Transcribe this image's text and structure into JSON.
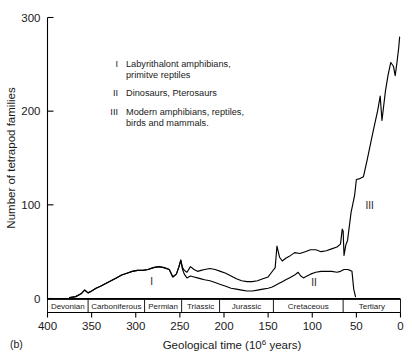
{
  "panel_label": "(b)",
  "chart_data": {
    "type": "line",
    "title": "",
    "xlabel": "Geological time (10⁶ years)",
    "xlabel_parts": {
      "pre": "Geological time (10",
      "sup": "6",
      "post": " years)"
    },
    "ylabel": "Number of tetrapod families",
    "xlim": [
      400,
      0
    ],
    "ylim": [
      0,
      300
    ],
    "x_ticks": [
      400,
      350,
      300,
      250,
      200,
      150,
      100,
      50,
      0
    ],
    "y_ticks": [
      0,
      100,
      200,
      300
    ],
    "x_axis_inverted": true,
    "grid": false,
    "legend_position": "inside-upper-left",
    "series": [
      {
        "name": "Total tetrapod families",
        "points": [
          [
            375,
            1
          ],
          [
            368,
            2
          ],
          [
            362,
            5
          ],
          [
            358,
            9
          ],
          [
            354,
            6
          ],
          [
            350,
            8
          ],
          [
            345,
            11
          ],
          [
            340,
            13
          ],
          [
            334,
            16
          ],
          [
            328,
            19
          ],
          [
            322,
            22
          ],
          [
            316,
            25
          ],
          [
            310,
            27
          ],
          [
            304,
            29
          ],
          [
            298,
            30
          ],
          [
            292,
            30
          ],
          [
            286,
            31
          ],
          [
            280,
            33
          ],
          [
            274,
            34
          ],
          [
            268,
            33
          ],
          [
            262,
            31
          ],
          [
            258,
            23
          ],
          [
            254,
            26
          ],
          [
            251,
            34
          ],
          [
            249,
            41
          ],
          [
            247,
            33
          ],
          [
            245,
            30
          ],
          [
            242,
            28
          ],
          [
            238,
            34
          ],
          [
            234,
            31
          ],
          [
            230,
            29
          ],
          [
            226,
            30
          ],
          [
            222,
            31
          ],
          [
            216,
            32
          ],
          [
            210,
            31
          ],
          [
            204,
            29
          ],
          [
            198,
            27
          ],
          [
            192,
            24
          ],
          [
            186,
            21
          ],
          [
            180,
            19
          ],
          [
            174,
            18
          ],
          [
            168,
            18
          ],
          [
            162,
            19
          ],
          [
            156,
            21
          ],
          [
            150,
            23
          ],
          [
            146,
            28
          ],
          [
            142,
            33
          ],
          [
            140,
            56
          ],
          [
            137,
            44
          ],
          [
            134,
            40
          ],
          [
            130,
            43
          ],
          [
            126,
            45
          ],
          [
            120,
            49
          ],
          [
            114,
            48
          ],
          [
            108,
            50
          ],
          [
            102,
            52
          ],
          [
            96,
            52
          ],
          [
            90,
            50
          ],
          [
            84,
            51
          ],
          [
            78,
            53
          ],
          [
            72,
            55
          ],
          [
            68,
            58
          ],
          [
            66,
            74
          ],
          [
            65,
            72
          ],
          [
            64,
            46
          ],
          [
            62,
            57
          ],
          [
            60,
            62
          ],
          [
            56,
            92
          ],
          [
            52,
            110
          ],
          [
            50,
            127
          ],
          [
            46,
            128
          ],
          [
            42,
            130
          ],
          [
            38,
            147
          ],
          [
            34,
            165
          ],
          [
            30,
            183
          ],
          [
            26,
            200
          ],
          [
            23,
            216
          ],
          [
            21,
            190
          ],
          [
            19,
            206
          ],
          [
            17,
            222
          ],
          [
            14,
            239
          ],
          [
            11,
            252
          ],
          [
            8,
            248
          ],
          [
            6,
            238
          ],
          [
            4,
            252
          ],
          [
            2,
            268
          ],
          [
            1,
            279
          ]
        ]
      },
      {
        "name": "Lower curve",
        "points": [
          [
            375,
            1
          ],
          [
            368,
            2
          ],
          [
            362,
            5
          ],
          [
            358,
            9
          ],
          [
            354,
            6
          ],
          [
            350,
            8
          ],
          [
            345,
            11
          ],
          [
            340,
            13
          ],
          [
            334,
            16
          ],
          [
            328,
            19
          ],
          [
            322,
            22
          ],
          [
            316,
            25
          ],
          [
            310,
            27
          ],
          [
            304,
            29
          ],
          [
            298,
            30
          ],
          [
            292,
            30
          ],
          [
            286,
            31
          ],
          [
            280,
            33
          ],
          [
            274,
            34
          ],
          [
            268,
            33
          ],
          [
            262,
            31
          ],
          [
            258,
            23
          ],
          [
            254,
            26
          ],
          [
            251,
            34
          ],
          [
            249,
            41
          ],
          [
            247,
            31
          ],
          [
            245,
            26
          ],
          [
            242,
            22
          ],
          [
            238,
            24
          ],
          [
            234,
            23
          ],
          [
            230,
            22
          ],
          [
            226,
            21
          ],
          [
            222,
            20
          ],
          [
            216,
            19
          ],
          [
            210,
            17
          ],
          [
            204,
            15
          ],
          [
            198,
            13
          ],
          [
            192,
            11
          ],
          [
            186,
            10
          ],
          [
            180,
            9
          ],
          [
            174,
            8
          ],
          [
            168,
            8
          ],
          [
            162,
            9
          ],
          [
            156,
            10
          ],
          [
            150,
            11
          ],
          [
            146,
            12
          ],
          [
            142,
            14
          ],
          [
            138,
            16
          ],
          [
            134,
            18
          ],
          [
            130,
            20
          ],
          [
            126,
            22
          ],
          [
            120,
            25
          ],
          [
            116,
            28
          ],
          [
            113,
            24
          ],
          [
            110,
            22
          ],
          [
            106,
            24
          ],
          [
            102,
            26
          ],
          [
            96,
            28
          ],
          [
            90,
            29
          ],
          [
            84,
            29
          ],
          [
            78,
            29
          ],
          [
            72,
            28
          ],
          [
            68,
            29
          ],
          [
            64,
            31
          ],
          [
            60,
            31
          ],
          [
            57,
            30
          ],
          [
            55,
            29
          ],
          [
            53,
            10
          ],
          [
            51,
            2
          ]
        ]
      }
    ],
    "annotations": [
      {
        "text": "I",
        "x": 282,
        "y": 14
      },
      {
        "text": "II",
        "x": 98,
        "y": 13
      },
      {
        "text": "III",
        "x": 35,
        "y": 96
      }
    ],
    "periods": [
      {
        "name": "Devonian",
        "start": 400,
        "end": 354
      },
      {
        "name": "Carboniferous",
        "start": 354,
        "end": 290
      },
      {
        "name": "Permian",
        "start": 290,
        "end": 248
      },
      {
        "name": "Triassic",
        "start": 248,
        "end": 205
      },
      {
        "name": "Jurassic",
        "start": 205,
        "end": 144
      },
      {
        "name": "Cretaceous",
        "start": 144,
        "end": 65
      },
      {
        "name": "Tertiary",
        "start": 65,
        "end": 0
      }
    ],
    "legend": [
      {
        "numeral": "I",
        "line1": "Labyrithalont amphibians,",
        "line2": "primitve reptiles"
      },
      {
        "numeral": "II",
        "line1": "Dinosaurs, Pterosaurs",
        "line2": ""
      },
      {
        "numeral": "III",
        "line1": "Modern amphibians, reptiles,",
        "line2": "birds and mammals."
      }
    ]
  }
}
